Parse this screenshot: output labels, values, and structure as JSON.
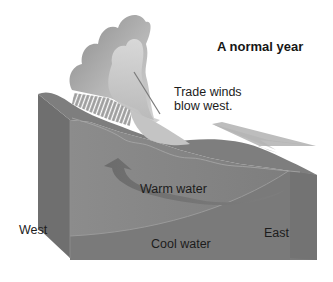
{
  "title": "A normal year",
  "labels": {
    "trade_winds_line1": "Trade winds",
    "trade_winds_line2": "blow west.",
    "warm_water": "Warm water",
    "cool_water": "Cool water",
    "west": "West",
    "east": "East"
  },
  "colors": {
    "background": "#ffffff",
    "ocean_top": "#7a7a7a",
    "ocean_front": "#8a8a8a",
    "ocean_side": "#6e6e6e",
    "cool_layer": "#7c7c7c",
    "warm_arrow": "#6a6a6a",
    "wind_arrow": "#bdbdbd",
    "cloud_dark": "#8c8c8c",
    "cloud_light": "#d8d8d8",
    "rain": "#ffffff",
    "text": "#1c1c1c"
  },
  "icons": {
    "wind_arrow": "wind-arrow-icon",
    "warm_current_arrow": "curved-arrow-icon",
    "cloud": "storm-cloud-icon",
    "rain": "rain-hatch-icon"
  }
}
